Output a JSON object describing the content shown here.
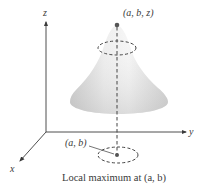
{
  "diagram": {
    "axes": {
      "z_label": "z",
      "y_label": "y",
      "x_label": "x"
    },
    "peak_label": "(a, b, z)",
    "point_label": "(a, b)",
    "caption": "Local maximum at (a, b)",
    "colors": {
      "axis": "#3a3a3a",
      "surface_light": "#f4f4f4",
      "surface_dark": "#c9c9c9",
      "dashed": "#444444",
      "point": "#555555"
    }
  }
}
